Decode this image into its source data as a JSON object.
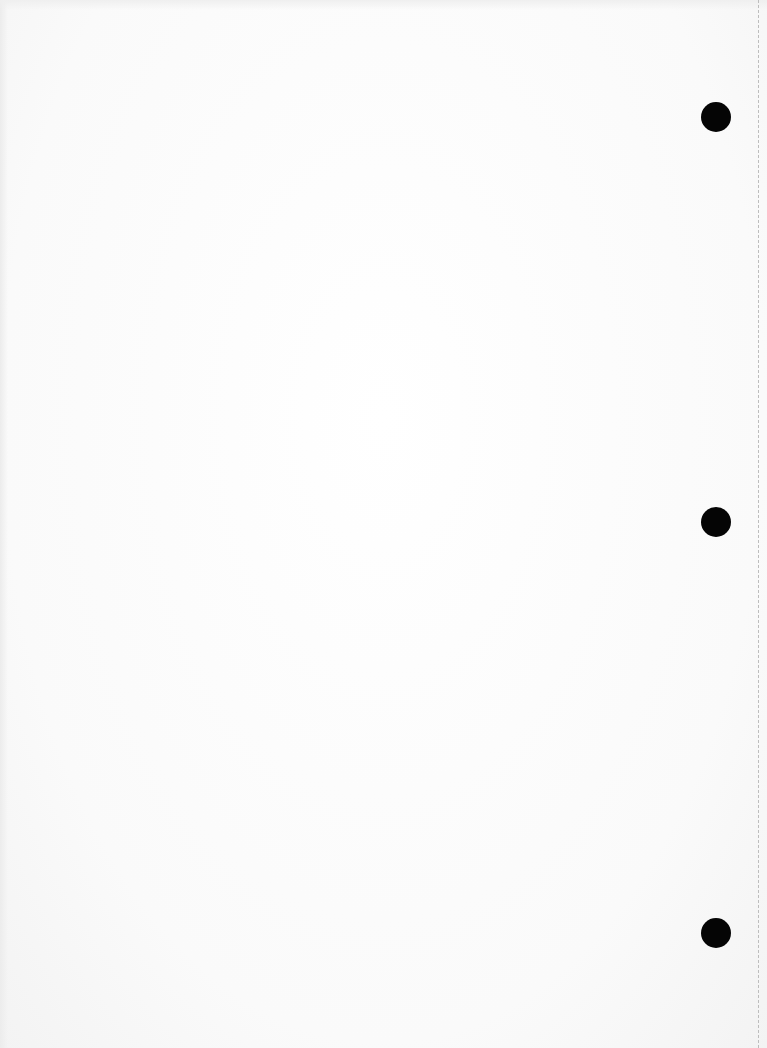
{
  "page": {
    "type": "blank-scanned-page",
    "background_color": "#fdfdfd",
    "text": ""
  },
  "punch_holes": [
    {
      "name": "top",
      "cx": 716,
      "cy": 117,
      "diameter": 30,
      "color": "#050505"
    },
    {
      "name": "middle",
      "cx": 716,
      "cy": 522,
      "diameter": 30,
      "color": "#050505"
    },
    {
      "name": "bottom",
      "cx": 716,
      "cy": 933,
      "diameter": 30,
      "color": "#050505"
    }
  ],
  "perforation_edge": {
    "x": 758,
    "style": "dashed",
    "color": "#bdbdbd"
  }
}
